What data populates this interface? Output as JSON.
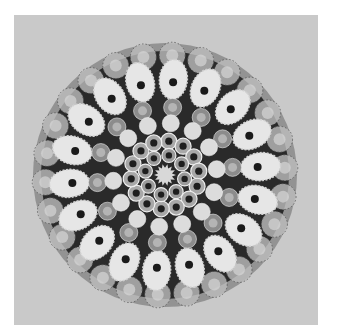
{
  "image": {
    "subject": "Millefiori glass paperweight, top view (grayscale photograph)",
    "background_color": "#c9c9c9",
    "frame": {
      "x": 14,
      "y": 15,
      "width": 304,
      "height": 310
    }
  },
  "paperweight": {
    "center": [
      165,
      175
    ],
    "radius": 132,
    "base_color": "#2a2a2a",
    "rim_color": "#8a8a8a",
    "center_cane": {
      "r": 11,
      "color": "#d8d8d8",
      "spikes": 14
    },
    "rings": [
      {
        "name": "hollow-inner",
        "count": 8,
        "ring_r": 20,
        "cane_r": 7,
        "fill": "#9a9a9a",
        "hole": "#1e1e1e",
        "hole_r": 3.2
      },
      {
        "name": "hollow-outer",
        "count": 14,
        "ring_r": 34,
        "cane_r": 8,
        "fill": "#a8a8a8",
        "hole": "#1e1e1e",
        "hole_r": 3.6
      },
      {
        "name": "light-round",
        "count": 14,
        "ring_r": 52,
        "cane_r": 8.5,
        "fill": "#dcdcdc",
        "hole": null,
        "hole_r": 0
      },
      {
        "name": "gray-ringed",
        "count": 14,
        "ring_r": 68,
        "cane_r": 9,
        "fill": "#8c8c8c",
        "hole": "#b4b4b4",
        "hole_r": 4.5
      },
      {
        "name": "white-flower",
        "count": 18,
        "ring_r": 96,
        "cane_r": 18,
        "fill": "#e6e6e6",
        "hole": "#1a1a1a",
        "hole_r": 4
      },
      {
        "name": "outer-translucent",
        "count": 26,
        "ring_r": 120,
        "cane_r": 13,
        "fill": "#bdbdbd",
        "hole": "#d6d6d6",
        "hole_r": 6
      }
    ]
  }
}
